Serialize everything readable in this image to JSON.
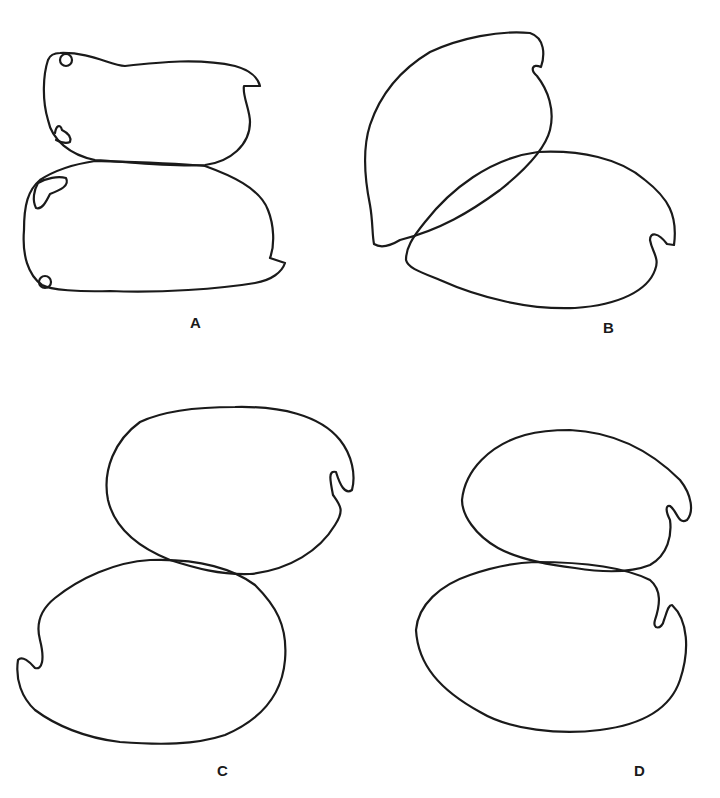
{
  "figure": {
    "panels": [
      {
        "id": "A",
        "label": "A",
        "description": "Two elongated outlines stacked vertically, touching; small notches at right; small lobes at left"
      },
      {
        "id": "B",
        "label": "B",
        "description": "Two oval outlines overlapping diagonally; notches at upper right and right"
      },
      {
        "id": "C",
        "label": "C",
        "description": "Two oval outlines stacked, slightly overlapping; notch right on upper, left on lower"
      },
      {
        "id": "D",
        "label": "D",
        "description": "Two oval outlines stacked, touching; notches on right side of each"
      }
    ],
    "stroke_color": "#1a1a1a",
    "background": "#ffffff"
  }
}
